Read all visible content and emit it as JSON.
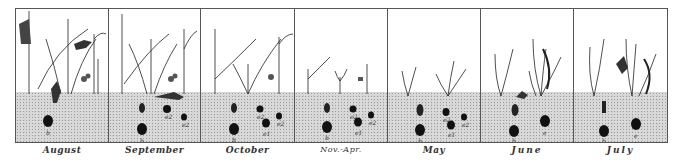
{
  "figure": {
    "type": "illustration",
    "colors": {
      "ink": "#222222",
      "soil": "#d9d9d9",
      "border": "#555555",
      "background": "#ffffff"
    },
    "panels": [
      {
        "month": "August",
        "soil_labels": [
          "b"
        ]
      },
      {
        "month": "September",
        "soil_labels": [
          "b",
          "e2",
          "e2"
        ]
      },
      {
        "month": "October",
        "soil_labels": [
          "b",
          "e2",
          "e1",
          "e2"
        ]
      },
      {
        "month": "Nov.-Apr.",
        "soil_labels": [
          "b",
          "e2",
          "e1",
          "e2"
        ]
      },
      {
        "month": "May",
        "soil_labels": [
          "b",
          "e2",
          "e1",
          "e2"
        ]
      },
      {
        "month": "June",
        "soil_labels": [
          "b",
          "e"
        ]
      },
      {
        "month": "July",
        "soil_labels": [
          "b",
          "e"
        ]
      }
    ]
  }
}
